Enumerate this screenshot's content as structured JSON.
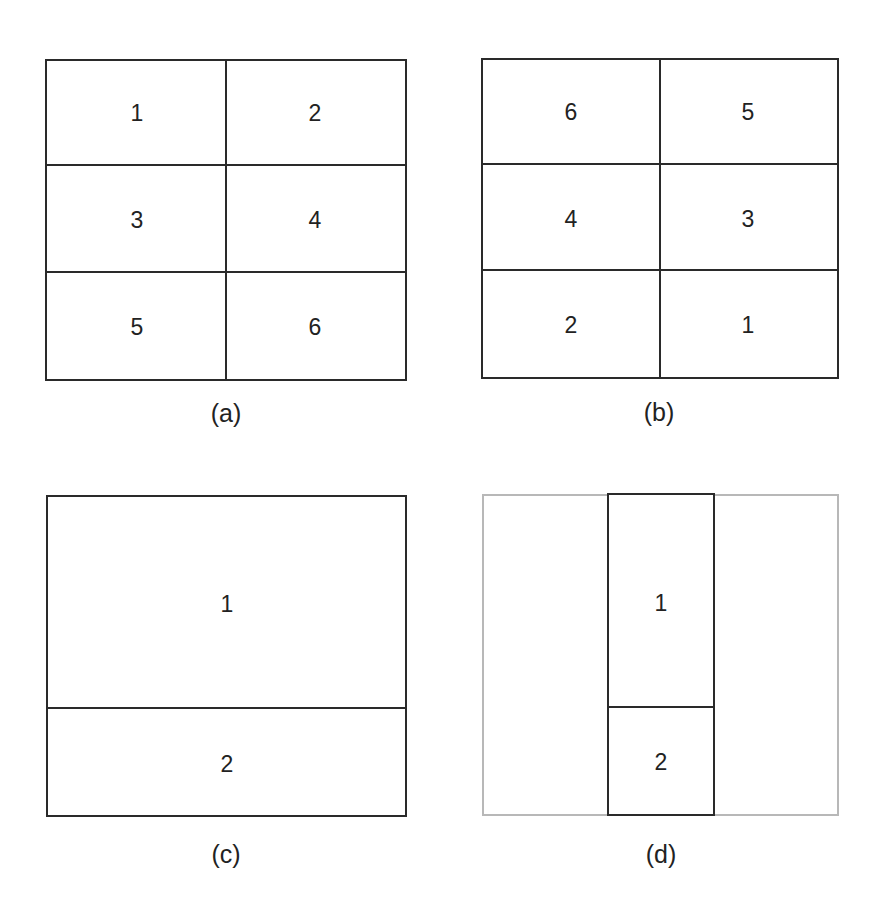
{
  "figure": {
    "panels": [
      {
        "id": "a",
        "caption": "(a)",
        "layout": "3x2 grid, row-major ordering",
        "cells": [
          "1",
          "2",
          "3",
          "4",
          "5",
          "6"
        ]
      },
      {
        "id": "b",
        "caption": "(b)",
        "layout": "3x2 grid, reversed ordering",
        "cells": [
          "6",
          "5",
          "4",
          "3",
          "2",
          "1"
        ]
      },
      {
        "id": "c",
        "caption": "(c)",
        "layout": "2 stacked rows, full width",
        "cells": [
          "1",
          "2"
        ]
      },
      {
        "id": "d",
        "caption": "(d)",
        "layout": "2 stacked rows, narrow centered column inside faint outer frame",
        "cells": [
          "1",
          "2"
        ]
      }
    ]
  },
  "colors": {
    "line": "#2a2a2a",
    "faint_frame": "#b8b8b8",
    "background": "#ffffff",
    "text": "#222222"
  }
}
